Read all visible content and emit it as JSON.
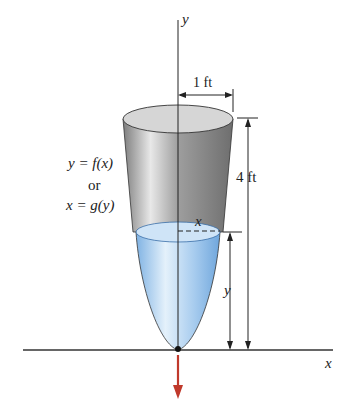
{
  "diagram": {
    "axes": {
      "x_label": "x",
      "y_label": "y"
    },
    "dimensions": {
      "radius_label": "1 ft",
      "height_label": "4 ft",
      "water_height_label": "y",
      "water_radius_label": "x"
    },
    "equation": {
      "line1": "y = f(x)",
      "line2": "or",
      "line3": "x = g(y)"
    },
    "colors": {
      "tank_gray": "#9a9a9a",
      "water_blue": "#a9cdee",
      "arrow_red": "#c0392b",
      "line": "#222222"
    }
  }
}
